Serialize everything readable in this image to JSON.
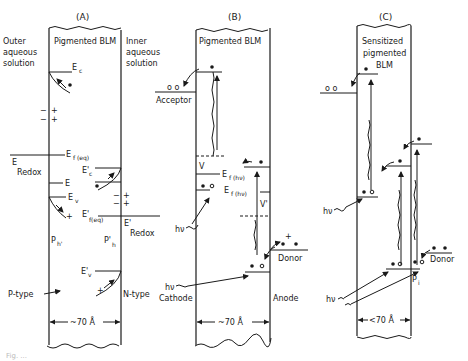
{
  "figure": {
    "panels": [
      {
        "id": "A",
        "label": "(A)",
        "membrane_title": "Pigmented BLM",
        "left_solution": [
          "Outer",
          "aqueous",
          "solution"
        ],
        "right_solution": [
          "Inner",
          "aqueous",
          "solution"
        ],
        "levels": {
          "Ec": "E",
          "Ec_sub": "c",
          "Ef_eq": "E",
          "Ef_eq_sub": "f (eq)",
          "E_redox": "E",
          "E_redox_sub": "Redox",
          "E_mid": "E",
          "Ev": "E",
          "Ev_sub": "v",
          "Ec_prime": "E'",
          "Ec_prime_sub": "c",
          "Ef_eq_prime": "E'",
          "Ef_eq_prime_sub": "f(eq)",
          "E_redox_prime": "E'",
          "E_redox_prime_sub": "Redox",
          "Ev_prime": "E'",
          "Ev_prime_sub": "v"
        },
        "charges": [
          "−",
          "+"
        ],
        "region_labels": {
          "ph": "P",
          "ph_sub": "h'",
          "ph_prime": "P'",
          "ph_prime_sub": "h"
        },
        "left_type": "P-type",
        "right_type": "N-type",
        "thickness": "~70 Å"
      },
      {
        "id": "B",
        "label": "(B)",
        "membrane_title": "Pigmented BLM",
        "acceptor": "Acceptor",
        "donor": "Donor",
        "cathode": "Cathode",
        "anode": "Anode",
        "fermi_label": "E",
        "fermi_sub": "f (hν)",
        "v_label": "V",
        "v_prime_label": "V'",
        "light": "hν",
        "plus": "+",
        "thickness": "~70 Å"
      },
      {
        "id": "C",
        "label": "(C)",
        "membrane_title": [
          "Sensitized",
          "pigmented",
          "BLM"
        ],
        "donor": "Donor",
        "pi": "P",
        "pi_sub": "i",
        "light": "hν",
        "thickness": "<70 Å"
      }
    ],
    "caption": "Fig. ..."
  }
}
